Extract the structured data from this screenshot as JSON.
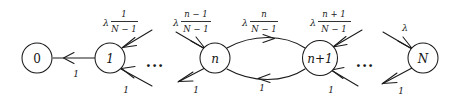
{
  "diagram": {
    "type": "state-transition-graph",
    "stroke_color": "#1a1a1a",
    "background_color": "#ffffff",
    "nodes": [
      {
        "id": "n0",
        "label": "0",
        "cx": 37,
        "cy": 58,
        "r": 15,
        "italic": false
      },
      {
        "id": "n1",
        "label": "1",
        "cx": 110,
        "cy": 58,
        "r": 15,
        "italic": true
      },
      {
        "id": "nn",
        "label": "n",
        "cx": 215,
        "cy": 58,
        "r": 15,
        "italic": true
      },
      {
        "id": "nn1",
        "label": "n+1",
        "cx": 320,
        "cy": 58,
        "r": 17.5,
        "italic": true
      },
      {
        "id": "nN",
        "label": "N",
        "cx": 423,
        "cy": 58,
        "r": 15,
        "italic": true
      }
    ],
    "ellipses": [
      {
        "id": "e1",
        "text": "...",
        "x": 155,
        "y": 62
      },
      {
        "id": "e2",
        "text": "...",
        "x": 365,
        "y": 62
      }
    ],
    "up_transitions": [
      {
        "id": "u1",
        "from": "0",
        "to": "1",
        "lambda": "λ",
        "numerator": "1",
        "denominator": "N − 1",
        "lx": 122,
        "ly": 22
      },
      {
        "id": "u2",
        "from": "n-1",
        "to": "n",
        "lambda": "λ",
        "numerator": "n − 1",
        "denominator": "N − 1",
        "lx": 194,
        "ly": 22
      },
      {
        "id": "u3",
        "from": "n",
        "to": "n+1",
        "lambda": "λ",
        "numerator": "n",
        "denominator": "N − 1",
        "lx": 262,
        "ly": 22
      },
      {
        "id": "u4",
        "from": "n+1",
        "to": "n+2",
        "lambda": "λ",
        "numerator": "n + 1",
        "denominator": "N − 1",
        "lx": 334,
        "ly": 22
      }
    ],
    "lambda_only_label": {
      "id": "u5",
      "text": "λ",
      "x": 405,
      "y": 27
    },
    "down_weights": [
      {
        "id": "d1",
        "text": "1",
        "x": 76,
        "y": 74
      },
      {
        "id": "d2",
        "text": "1",
        "x": 126,
        "y": 90
      },
      {
        "id": "d3",
        "text": "1",
        "x": 196,
        "y": 90
      },
      {
        "id": "d4",
        "text": "1",
        "x": 262,
        "y": 88
      },
      {
        "id": "d5",
        "text": "1",
        "x": 331,
        "y": 90
      },
      {
        "id": "d6",
        "text": "1",
        "x": 401,
        "y": 91
      }
    ]
  }
}
